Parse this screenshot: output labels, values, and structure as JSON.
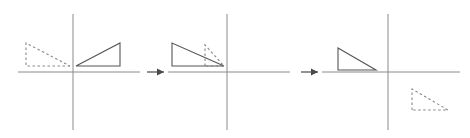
{
  "figure": {
    "title": "",
    "width": 470,
    "height": 138,
    "background": "#ffffff",
    "axis_color": "#8a8a8a",
    "shape_solid_color": "#555555",
    "shape_dashed_color": "#888888",
    "arrow_color": "#4a4a4a",
    "axis_stroke_width": 1,
    "shape_stroke_width": 1.1,
    "dash_pattern": "2.5,2.5"
  },
  "chart_data": {
    "type": "diagram",
    "panels": [
      {
        "index": 1,
        "name": "panel-1",
        "origin": [
          73,
          72
        ],
        "x_axis": {
          "x1": 18,
          "x2": 140,
          "y": 72
        },
        "y_axis": {
          "x": 73,
          "y1": 14,
          "y2": 130
        },
        "shapes": [
          {
            "name": "solid-triangle",
            "style": "solid",
            "points": "76,66 120,66 120,43",
            "vertices": [
              [
                76,
                66
              ],
              [
                120,
                66
              ],
              [
                120,
                43
              ]
            ],
            "quadrant": "I",
            "note": "right angle at lower-right, hypotenuse rises left-to-right"
          },
          {
            "name": "dashed-triangle",
            "style": "dashed",
            "points": "70,66 26,66 26,43",
            "vertices": [
              [
                70,
                66
              ],
              [
                26,
                66
              ],
              [
                26,
                43
              ]
            ],
            "quadrant": "II",
            "note": "mirror image of solid triangle across the y-axis"
          }
        ]
      },
      {
        "index": 2,
        "name": "panel-2",
        "origin": [
          227,
          72
        ],
        "x_axis": {
          "x1": 168,
          "x2": 290,
          "y": 72
        },
        "y_axis": {
          "x": 227,
          "y1": 14,
          "y2": 130
        },
        "shapes": [
          {
            "name": "solid-triangle",
            "style": "solid",
            "points": "172,66 172,43 224,66",
            "vertices": [
              [
                172,
                66
              ],
              [
                172,
                43
              ],
              [
                224,
                66
              ]
            ],
            "quadrant": "II",
            "note": "right angle at lower-left, hypotenuse falls left-to-right"
          },
          {
            "name": "dashed-triangle",
            "style": "dashed",
            "points": "205,66 205,45 224,66",
            "vertices": [
              [
                205,
                66
              ],
              [
                205,
                45
              ],
              [
                224,
                66
              ]
            ],
            "quadrant": "II",
            "note": "smaller dashed triangle tucked against the y-axis"
          }
        ]
      },
      {
        "index": 3,
        "name": "panel-3",
        "origin": [
          388,
          72
        ],
        "x_axis": {
          "x1": 322,
          "x2": 460,
          "y": 72
        },
        "y_axis": {
          "x": 388,
          "y1": 14,
          "y2": 130
        },
        "shapes": [
          {
            "name": "solid-triangle",
            "style": "solid",
            "points": "338,70 338,48 376,70",
            "vertices": [
              [
                338,
                70
              ],
              [
                338,
                48
              ],
              [
                376,
                70
              ]
            ],
            "quadrant": "II",
            "note": "right angle at lower-left, hypotenuse falls left-to-right"
          },
          {
            "name": "dashed-triangle",
            "style": "dashed",
            "points": "412,110 412,89 448,110",
            "vertices": [
              [
                412,
                110
              ],
              [
                412,
                89
              ],
              [
                448,
                110
              ]
            ],
            "quadrant": "IV",
            "note": "dashed image reflected below the x-axis"
          }
        ]
      }
    ],
    "arrows": [
      {
        "name": "arrow-1",
        "from": [
          147,
          72
        ],
        "to": [
          164,
          72
        ],
        "label": ""
      },
      {
        "name": "arrow-2",
        "from": [
          301,
          72
        ],
        "to": [
          318,
          72
        ],
        "label": ""
      }
    ],
    "labels": []
  }
}
